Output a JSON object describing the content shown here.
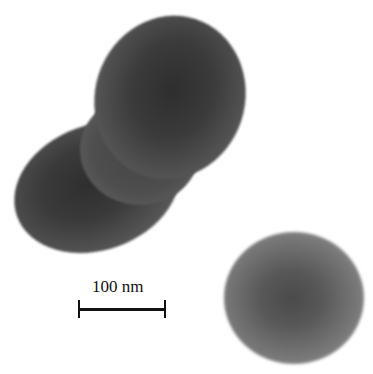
{
  "image": {
    "description": "Grayscale transmission electron micrograph showing a peanut-shaped particle and a spherical particle",
    "particles": [
      {
        "name": "peanut-shaped particle",
        "shade": "#3a3a3a"
      },
      {
        "name": "spherical particle",
        "shade": "#5a5a5a"
      }
    ],
    "background_color": "#ffffff"
  },
  "scale_bar": {
    "label": "100 nm",
    "color": "#111111"
  }
}
